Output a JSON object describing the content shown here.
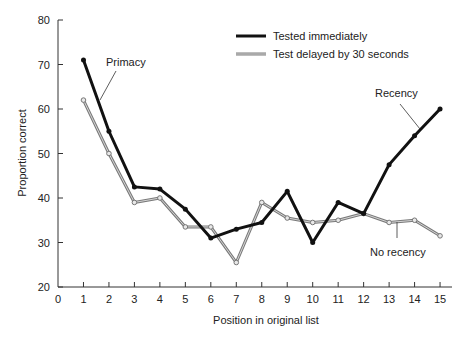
{
  "chart_data": {
    "type": "line",
    "title": "",
    "xlabel": "Position in original list",
    "ylabel": "Proportion correct",
    "xlim": [
      0,
      15
    ],
    "ylim": [
      20,
      80
    ],
    "xticks": [
      0,
      1,
      2,
      3,
      4,
      5,
      6,
      7,
      8,
      9,
      10,
      11,
      12,
      13,
      14,
      15
    ],
    "yticks": [
      20,
      30,
      40,
      50,
      60,
      70,
      80
    ],
    "grid": false,
    "legend_position": "top-right",
    "x": [
      1,
      2,
      3,
      4,
      5,
      6,
      7,
      8,
      9,
      10,
      11,
      12,
      13,
      14,
      15
    ],
    "series": [
      {
        "name": "Tested immediately",
        "color": "#111111",
        "values": [
          71,
          55,
          42.5,
          42,
          37.5,
          31,
          33,
          34.5,
          41.5,
          30,
          39,
          36.5,
          47.5,
          54,
          60
        ]
      },
      {
        "name": "Test delayed by 30 seconds",
        "color": "#8a8a8a",
        "values": [
          62,
          50,
          39,
          40,
          33.5,
          33.5,
          25.5,
          39,
          35.5,
          34.5,
          35,
          36.5,
          34.5,
          35,
          31.5
        ]
      }
    ],
    "annotations": [
      {
        "text": "Primacy",
        "x": 2.3,
        "y": 69
      },
      {
        "text": "Recency",
        "x": 13.3,
        "y": 63
      },
      {
        "text": "No recency",
        "x": 13.2,
        "y": 27
      }
    ]
  },
  "legend": {
    "items": [
      {
        "label": "Tested immediately"
      },
      {
        "label": "Test delayed by 30 seconds"
      }
    ]
  },
  "axes": {
    "xlabel": "Position in original list",
    "ylabel": "Proportion correct"
  },
  "annotations": {
    "primacy": "Primacy",
    "recency": "Recency",
    "no_recency": "No recency"
  }
}
